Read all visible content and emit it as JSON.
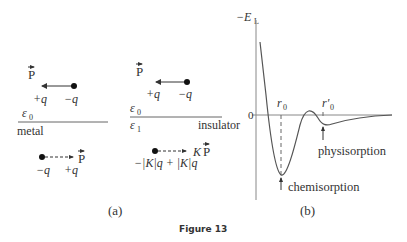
{
  "figure": {
    "caption": "Figure 13",
    "panel_a_label": "(a)",
    "panel_b_label": "(b)"
  },
  "panel_a": {
    "metal": {
      "medium_label": "metal",
      "permittivity_label": "ε",
      "permittivity_sub": "0",
      "real_dipole": {
        "vector_label": "P",
        "charge_left": "+q",
        "charge_right": "−q"
      },
      "image_dipole": {
        "vector_label": "P",
        "charge_left": "−q",
        "charge_right": "+q"
      }
    },
    "insulator": {
      "medium_label": "insulator",
      "permittivity_top_label": "ε",
      "permittivity_top_sub": "0",
      "permittivity_bottom_label": "ε",
      "permittivity_bottom_sub": "1",
      "real_dipole": {
        "vector_label": "P",
        "charge_left": "+q",
        "charge_right": "−q"
      },
      "image_dipole": {
        "vector_label": "P",
        "factor": "K",
        "charges": "−|K|q + |K|q"
      }
    }
  },
  "panel_b": {
    "y_axis_label": "−E",
    "y_axis_sub": "L",
    "zero_label": "0",
    "r0_label": "r",
    "r0_sub": "0",
    "r0p_label": "r′",
    "r0p_sub": "0",
    "annotations": {
      "deep_min": "chemisorption",
      "shallow_min": "physisorption"
    }
  },
  "colors": {
    "ink": "#333333",
    "axis": "#888888",
    "curve": "#555555"
  }
}
